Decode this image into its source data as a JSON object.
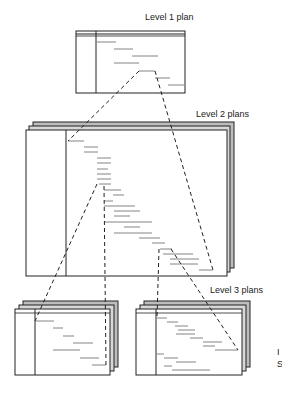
{
  "labels": {
    "level1": "Level 1 plan",
    "level2": "Level 2 plans",
    "level3": "Level 3 plans",
    "edge_fragment_1": "I",
    "edge_fragment_2": "S"
  },
  "colors": {
    "line": "#222222",
    "shadow_fill": "#bdbdbd",
    "bar": "#555555"
  }
}
